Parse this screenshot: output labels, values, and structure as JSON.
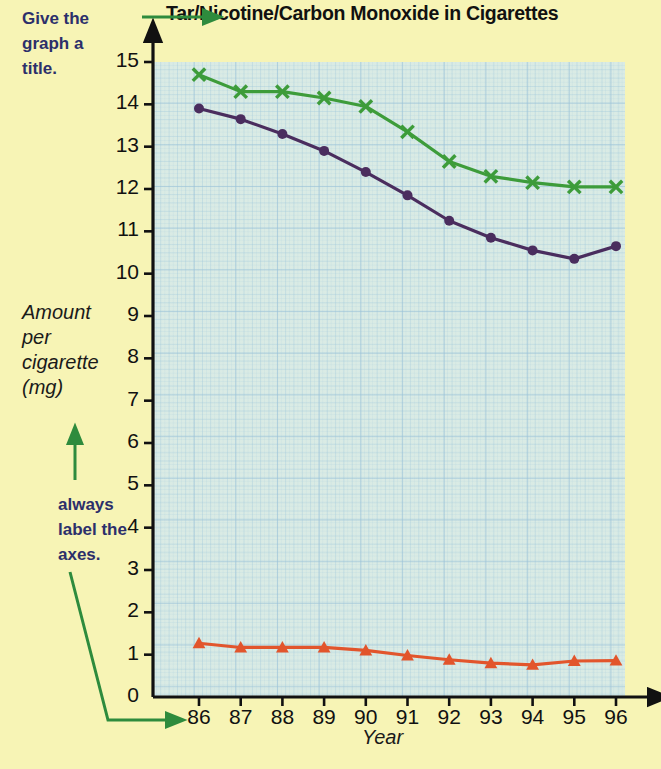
{
  "annotations": {
    "title_note": "Give the\ngraph a\ntitle.",
    "axes_note": "always\nlabel the\naxes.",
    "note_color": "#2c2f6b",
    "arrow_color": "#2e8b3d"
  },
  "chart_data": {
    "type": "line",
    "title": "Tar/Nicotine/Carbon Monoxide in Cigarettes",
    "xlabel": "Year",
    "ylabel": "Amount\nper\ncigarette\n(mg)",
    "categories": [
      "86",
      "87",
      "88",
      "89",
      "90",
      "91",
      "92",
      "93",
      "94",
      "95",
      "96"
    ],
    "x": [
      86,
      87,
      88,
      89,
      90,
      91,
      92,
      93,
      94,
      95,
      96
    ],
    "ylim": [
      0,
      15
    ],
    "yticks": [
      0,
      1,
      2,
      3,
      4,
      5,
      6,
      7,
      8,
      9,
      10,
      11,
      12,
      13,
      14,
      15
    ],
    "ytick_labels": [
      "0",
      "1",
      "2",
      "3",
      "4",
      "5",
      "6",
      "7",
      "8",
      "9",
      "10",
      "11",
      "12",
      "13",
      "14",
      "15"
    ],
    "grid": true,
    "legend": "none",
    "series": [
      {
        "name": "Carbon Monoxide",
        "color": "#3d9c3a",
        "marker": "x",
        "values": [
          14.7,
          14.3,
          14.3,
          14.15,
          13.95,
          13.35,
          12.65,
          12.3,
          12.15,
          12.05,
          12.05
        ]
      },
      {
        "name": "Tar",
        "color": "#4a2d5e",
        "marker": "circle",
        "values": [
          13.9,
          13.65,
          13.3,
          12.9,
          12.4,
          11.85,
          11.25,
          10.85,
          10.55,
          10.35,
          10.65
        ]
      },
      {
        "name": "Nicotine",
        "color": "#e2552c",
        "marker": "triangle",
        "values": [
          1.27,
          1.17,
          1.17,
          1.17,
          1.1,
          0.98,
          0.88,
          0.8,
          0.76,
          0.85,
          0.86
        ]
      }
    ]
  }
}
